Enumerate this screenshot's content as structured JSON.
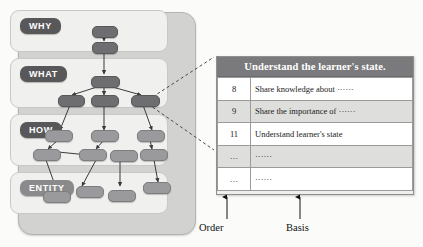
{
  "diagram": {
    "layers": [
      {
        "id": "why",
        "label": "WHY"
      },
      {
        "id": "what",
        "label": "WHAT"
      },
      {
        "id": "how",
        "label": "HOW"
      },
      {
        "id": "entity",
        "label": "ENTITY"
      }
    ]
  },
  "detail_table": {
    "title": "Understand the learner's state.",
    "columns": [
      "Order",
      "Basis"
    ],
    "rows": [
      {
        "order": "8",
        "basis": "Share knowledge about ······"
      },
      {
        "order": "9",
        "basis": "Share the importance of ······"
      },
      {
        "order": "11",
        "basis": "Understand learner's state"
      },
      {
        "order": "…",
        "basis": "······"
      },
      {
        "order": "…",
        "basis": "······"
      }
    ],
    "annotations": {
      "order_label": "Order",
      "basis_label": "Basis"
    }
  },
  "colors": {
    "frame": "#d2d2d0",
    "band": "#f0f0ee",
    "layer_label": "#58585a",
    "entity_label": "#8a8a8c",
    "node": "#9a9a9c",
    "node_dark": "#6e6e70",
    "table_header": "#7a7a7c",
    "row_alt": "#dededc"
  }
}
